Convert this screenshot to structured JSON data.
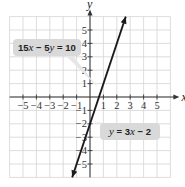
{
  "chart_data": {
    "type": "line",
    "title": "",
    "xlabel": "x",
    "ylabel": "y",
    "xlim": [
      -6,
      6
    ],
    "ylim": [
      -6,
      6
    ],
    "grid": true,
    "x_ticks": [
      -5,
      -4,
      -3,
      -2,
      -1,
      1,
      2,
      3,
      4,
      5
    ],
    "y_ticks": [
      5,
      4,
      3,
      2,
      1,
      -1,
      -2,
      -3,
      -4,
      -5
    ],
    "series": [
      {
        "name": "y = 3x - 2",
        "equation": "y = 3x - 2",
        "equivalent_form": "15x - 5y = 10",
        "slope": 3,
        "intercept": -2,
        "x": [
          -1.33,
          2.67
        ],
        "y": [
          -6,
          6
        ]
      }
    ],
    "annotations": [
      {
        "text": "15x − 5y = 10",
        "points_to": [
          0.67,
          0
        ],
        "box_color": "#d9d9d9"
      },
      {
        "text": "y = 3x − 2",
        "points_to": [
          0,
          -2
        ],
        "box_color": "#d9d9d9"
      }
    ]
  },
  "labels": {
    "axis_x": "x",
    "axis_y": "y",
    "eq_top": {
      "a": "15",
      "v1": "x",
      "op": " − 5",
      "v2": "y",
      "rest": " = 10"
    },
    "eq_bottom": {
      "v1": "y",
      "mid": " = 3",
      "v2": "x",
      "rest": " − 2"
    }
  },
  "colors": {
    "grid": "#d4d4d4",
    "axis": "#333333",
    "line": "#1a1a1a",
    "label_box": "#d9d9d9"
  }
}
